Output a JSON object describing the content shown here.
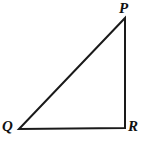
{
  "figure": {
    "type": "geometry-diagram",
    "shape": "right-triangle",
    "background_color": "#ffffff",
    "stroke_color": "#1a1a1a",
    "stroke_width": 2,
    "canvas": {
      "width": 150,
      "height": 147
    },
    "vertices": [
      {
        "id": "P",
        "label": "P",
        "x": 125,
        "y": 18,
        "label_x": 119,
        "label_y": 1,
        "position": "top-right"
      },
      {
        "id": "Q",
        "label": "Q",
        "x": 19,
        "y": 129,
        "label_x": 2,
        "label_y": 119,
        "position": "bottom-left"
      },
      {
        "id": "R",
        "label": "R",
        "x": 125,
        "y": 128,
        "label_x": 128,
        "label_y": 119,
        "position": "bottom-right",
        "right_angle": true
      }
    ],
    "edges": [
      {
        "id": "PQ",
        "from": "P",
        "to": "Q",
        "role": "hypotenuse"
      },
      {
        "id": "QR",
        "from": "Q",
        "to": "R",
        "role": "base"
      },
      {
        "id": "RP",
        "from": "R",
        "to": "P",
        "role": "vertical-leg"
      }
    ],
    "polygon_points": "125,18 19,129 125,128"
  }
}
